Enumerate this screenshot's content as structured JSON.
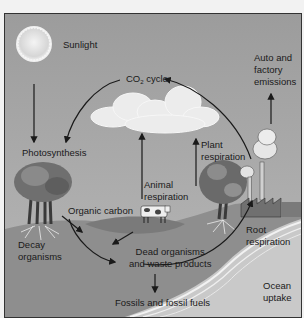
{
  "diagram": {
    "title": "CO2 cycle",
    "labels": {
      "sunlight": "Sunlight",
      "co2_prefix": "CO",
      "co2_sub": "2",
      "co2_suffix": " cycle",
      "auto_line1": "Auto and",
      "auto_line2": "factory",
      "auto_line3": "emissions",
      "photosynthesis": "Photosynthesis",
      "plant_line1": "Plant",
      "plant_line2": "respiration",
      "animal_line1": "Animal",
      "animal_line2": "respiration",
      "organic_carbon": "Organic carbon",
      "decay_line1": "Decay",
      "decay_line2": "organisms",
      "dead_line1": "Dead organisms",
      "dead_line2": "and waste products",
      "root_line1": "Root",
      "root_line2": "respiration",
      "ocean_line1": "Ocean",
      "ocean_line2": "uptake",
      "fossils": "Fossils and fossil fuels"
    },
    "icons": [
      "sun-icon",
      "cloud-icon",
      "tree-icon",
      "cow-icon",
      "factory-icon",
      "ocean-icon"
    ],
    "colors": {
      "sky": "#a9a9a9",
      "ground": "#8c8c8c",
      "ocean": "#c8c8c8",
      "arrow": "#1a1a1a"
    }
  }
}
